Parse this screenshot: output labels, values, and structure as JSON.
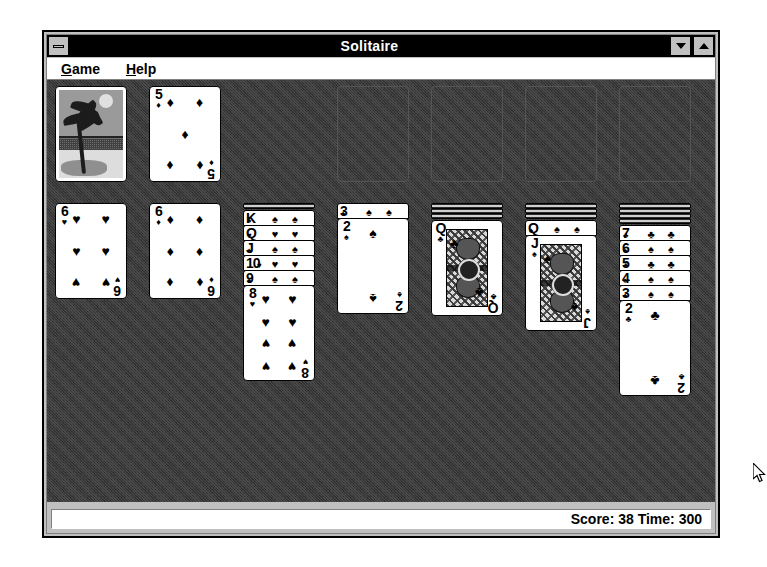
{
  "window": {
    "title": "Solitaire",
    "minimize_label": "minimize",
    "restore_down_label": "restore-down",
    "maximize_label": "maximize"
  },
  "menu": {
    "items": [
      {
        "label": "Game",
        "accel": "G",
        "rest": "ame"
      },
      {
        "label": "Help",
        "accel": "H",
        "rest": "elp"
      }
    ]
  },
  "status": {
    "text": "Score: 38 Time: 300",
    "score_label": "Score:",
    "score_value": 38,
    "time_label": "Time:",
    "time_value": 300
  },
  "colors": {
    "titlebar": "#000000",
    "titlebar_text": "#ffffff",
    "face": "#c0c0c0",
    "felt": "#3a3a3a",
    "card_face": "#ffffff",
    "card_ink": "#000000"
  },
  "table": {
    "stock": {
      "name": "stock-pile",
      "face_down": true,
      "back_design": "palm-tree-beach"
    },
    "waste": {
      "name": "waste-pile",
      "rank": "5",
      "suit": "diamonds",
      "glyph": "♦",
      "pip_count": 5
    },
    "foundations": [
      {
        "name": "foundation-1",
        "empty": true
      },
      {
        "name": "foundation-2",
        "empty": true
      },
      {
        "name": "foundation-3",
        "empty": true
      },
      {
        "name": "foundation-4",
        "empty": true
      }
    ],
    "tableau": [
      {
        "name": "tableau-column-1",
        "face_down_count": 0,
        "cards": [
          {
            "rank": "6",
            "suit": "hearts",
            "glyph": "♥",
            "pip_count": 6,
            "face_up": true,
            "covered": false
          }
        ]
      },
      {
        "name": "tableau-column-2",
        "face_down_count": 0,
        "cards": [
          {
            "rank": "6",
            "suit": "diamonds",
            "glyph": "♦",
            "pip_count": 6,
            "face_up": true,
            "covered": false
          }
        ]
      },
      {
        "name": "tableau-column-3",
        "face_down_count": 1,
        "cards": [
          {
            "rank": "K",
            "suit": "spades",
            "glyph": "♠",
            "face_up": true,
            "covered": true
          },
          {
            "rank": "Q",
            "suit": "hearts",
            "glyph": "♥",
            "face_up": true,
            "covered": true
          },
          {
            "rank": "J",
            "suit": "spades",
            "glyph": "♠",
            "face_up": true,
            "covered": true
          },
          {
            "rank": "10",
            "suit": "hearts",
            "glyph": "♥",
            "face_up": true,
            "covered": true
          },
          {
            "rank": "9",
            "suit": "spades",
            "glyph": "♠",
            "face_up": true,
            "covered": true
          },
          {
            "rank": "8",
            "suit": "hearts",
            "glyph": "♥",
            "pip_count": 8,
            "face_up": true,
            "covered": false
          }
        ]
      },
      {
        "name": "tableau-column-4",
        "face_down_count": 0,
        "cards": [
          {
            "rank": "3",
            "suit": "spades",
            "glyph": "♠",
            "face_up": true,
            "covered": true
          },
          {
            "rank": "2",
            "suit": "spades",
            "glyph": "♠",
            "pip_count": 2,
            "face_up": true,
            "covered": false
          }
        ]
      },
      {
        "name": "tableau-column-5",
        "face_down_count": 3,
        "cards": [
          {
            "rank": "Q",
            "suit": "clubs",
            "glyph": "♣",
            "face_up": true,
            "covered": false,
            "court": true
          }
        ]
      },
      {
        "name": "tableau-column-6",
        "face_down_count": 3,
        "cards": [
          {
            "rank": "Q",
            "suit": "spades",
            "glyph": "♠",
            "face_up": true,
            "covered": true
          },
          {
            "rank": "J",
            "suit": "spades",
            "glyph": "♠",
            "face_up": true,
            "covered": false,
            "court": true
          }
        ]
      },
      {
        "name": "tableau-column-7",
        "face_down_count": 4,
        "cards": [
          {
            "rank": "7",
            "suit": "clubs",
            "glyph": "♣",
            "face_up": true,
            "covered": true
          },
          {
            "rank": "6",
            "suit": "spades",
            "glyph": "♠",
            "face_up": true,
            "covered": true
          },
          {
            "rank": "5",
            "suit": "clubs",
            "glyph": "♣",
            "face_up": true,
            "covered": true
          },
          {
            "rank": "4",
            "suit": "spades",
            "glyph": "♠",
            "face_up": true,
            "covered": true
          },
          {
            "rank": "3",
            "suit": "spades",
            "glyph": "♠",
            "face_up": true,
            "covered": true
          },
          {
            "rank": "2",
            "suit": "clubs",
            "glyph": "♣",
            "pip_count": 2,
            "face_up": true,
            "covered": false
          }
        ]
      }
    ]
  },
  "cursor": {
    "name": "mouse-pointer",
    "x": 753,
    "y": 463
  }
}
